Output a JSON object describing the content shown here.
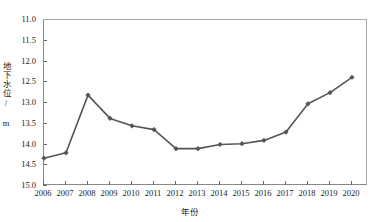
{
  "chart_data": {
    "type": "line",
    "title": "",
    "xlabel": "年份",
    "ylabel": "地下水位/ m",
    "categories": [
      "2006",
      "2007",
      "2008",
      "2009",
      "2010",
      "2011",
      "2012",
      "2013",
      "2014",
      "2015",
      "2016",
      "2017",
      "2018",
      "2019",
      "2020"
    ],
    "values": [
      14.33,
      14.2,
      12.81,
      13.37,
      13.55,
      13.64,
      14.1,
      14.1,
      14.0,
      13.98,
      13.9,
      13.7,
      13.02,
      12.75,
      12.38
    ],
    "ylim": [
      11.0,
      15.0
    ],
    "y_inverted": true,
    "y_ticks": [
      "11.0",
      "11.5",
      "12.0",
      "12.5",
      "13.0",
      "13.5",
      "14.0",
      "14.5",
      "15.0"
    ],
    "y_tick_values": [
      11.0,
      11.5,
      12.0,
      12.5,
      13.0,
      13.5,
      14.0,
      14.5,
      15.0
    ],
    "grid": false,
    "legend": "none",
    "series_color": "#555555",
    "marker": "diamond",
    "axis_color": "#888888"
  }
}
